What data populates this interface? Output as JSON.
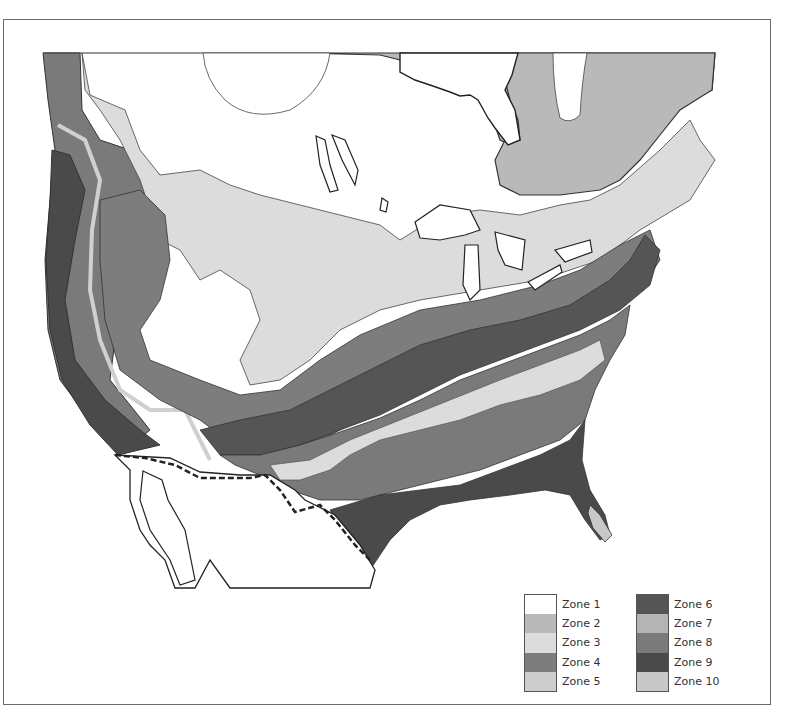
{
  "figure": {
    "frame_border_color": "#6b6b6b"
  },
  "legend": {
    "columns": [
      {
        "items": [
          {
            "label": "Zone 1",
            "color": "#ffffff"
          },
          {
            "label": "Zone 2",
            "color": "#b9b9b9"
          },
          {
            "label": "Zone 3",
            "color": "#dcdcdc"
          },
          {
            "label": "Zone 4",
            "color": "#7d7d7d"
          },
          {
            "label": "Zone 5",
            "color": "#cdcdcd"
          }
        ]
      },
      {
        "items": [
          {
            "label": "Zone 6",
            "color": "#555555"
          },
          {
            "label": "Zone 7",
            "color": "#b4b4b4"
          },
          {
            "label": "Zone 8",
            "color": "#7a7a7a"
          },
          {
            "label": "Zone 9",
            "color": "#4a4a4a"
          },
          {
            "label": "Zone 10",
            "color": "#c8c8c8"
          }
        ]
      }
    ]
  },
  "map": {
    "features": {
      "us_mexico_border": "dashed",
      "great_lakes": "white",
      "mexico": "white outline"
    }
  }
}
